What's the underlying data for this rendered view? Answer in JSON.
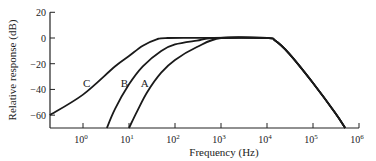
{
  "chart_data": {
    "type": "line",
    "title": "",
    "xlabel": "Frequency (Hz)",
    "ylabel": "Relative response (dB)",
    "xscale": "log",
    "xlim": [
      0.19,
      1000000
    ],
    "ylim": [
      -70,
      20
    ],
    "grid": false,
    "legend": "inline curve labels",
    "x_ticks": [
      {
        "value": 1,
        "base": "10",
        "exp": "0"
      },
      {
        "value": 10,
        "base": "10",
        "exp": "1"
      },
      {
        "value": 100,
        "base": "10",
        "exp": "2"
      },
      {
        "value": 1000,
        "base": "10",
        "exp": "3"
      },
      {
        "value": 10000,
        "base": "10",
        "exp": "4"
      },
      {
        "value": 100000,
        "base": "10",
        "exp": "5"
      },
      {
        "value": 1000000,
        "base": "10",
        "exp": "6"
      }
    ],
    "y_ticks": [
      20,
      0,
      -20,
      -40,
      -60
    ],
    "series": [
      {
        "name": "C",
        "label_at": {
          "x": 1.2,
          "y": -38
        },
        "points": [
          [
            0.19,
            -60
          ],
          [
            1,
            -44
          ],
          [
            5,
            -22
          ],
          [
            10,
            -14
          ],
          [
            20,
            -6
          ],
          [
            40,
            -1
          ],
          [
            70,
            0
          ],
          [
            1000,
            0
          ],
          [
            10000,
            0
          ],
          [
            15000,
            -2
          ],
          [
            30000,
            -12
          ],
          [
            100000,
            -35
          ],
          [
            300000,
            -58
          ],
          [
            500000,
            -70
          ]
        ]
      },
      {
        "name": "B",
        "label_at": {
          "x": 8,
          "y": -38
        },
        "points": [
          [
            3.3,
            -70
          ],
          [
            5,
            -55
          ],
          [
            10,
            -36
          ],
          [
            20,
            -22
          ],
          [
            50,
            -10
          ],
          [
            100,
            -5
          ],
          [
            300,
            -2
          ],
          [
            700,
            0
          ],
          [
            10000,
            0
          ],
          [
            15000,
            -2
          ],
          [
            30000,
            -12
          ],
          [
            100000,
            -35
          ],
          [
            300000,
            -58
          ],
          [
            500000,
            -70
          ]
        ]
      },
      {
        "name": "A",
        "label_at": {
          "x": 22,
          "y": -38
        },
        "points": [
          [
            10,
            -70
          ],
          [
            15,
            -57
          ],
          [
            25,
            -42
          ],
          [
            50,
            -27
          ],
          [
            100,
            -17
          ],
          [
            300,
            -7
          ],
          [
            1000,
            0
          ],
          [
            10000,
            0
          ],
          [
            15000,
            -2
          ],
          [
            30000,
            -12
          ],
          [
            100000,
            -35
          ],
          [
            300000,
            -58
          ],
          [
            500000,
            -70
          ]
        ]
      }
    ]
  }
}
